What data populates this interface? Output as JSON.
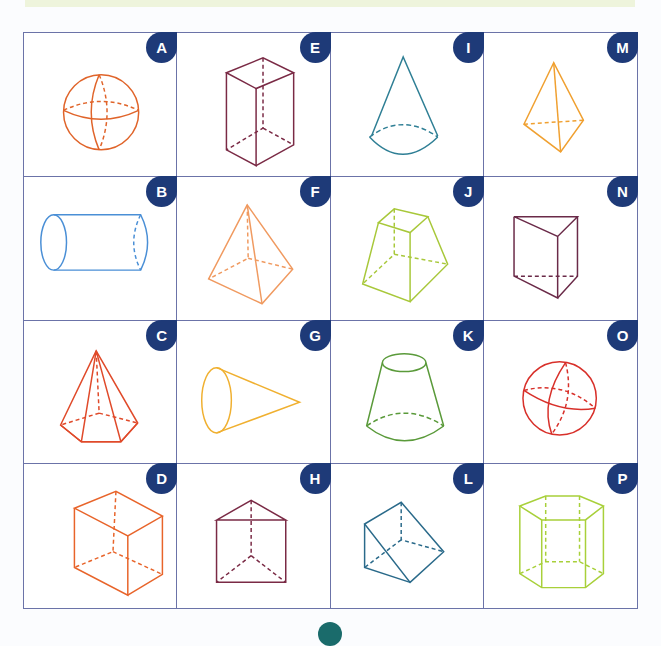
{
  "colors": {
    "grid_border": "#6b73a8",
    "badge_bg": "#1e3a78",
    "badge_text": "#ffffff",
    "top_band": "#eef4dc",
    "bottom_dot": "#1a6b6b"
  },
  "cells": [
    {
      "letter": "A",
      "shape": "sphere",
      "color": "#e0642a"
    },
    {
      "letter": "E",
      "shape": "rectangular-prism",
      "color": "#7a2a45"
    },
    {
      "letter": "I",
      "shape": "cone",
      "color": "#2f7f95"
    },
    {
      "letter": "M",
      "shape": "triangular-pyramid",
      "color": "#f0a030"
    },
    {
      "letter": "B",
      "shape": "cylinder",
      "color": "#4a8fd6"
    },
    {
      "letter": "F",
      "shape": "square-pyramid",
      "color": "#f09a60"
    },
    {
      "letter": "J",
      "shape": "square-frustum",
      "color": "#a8c83a"
    },
    {
      "letter": "N",
      "shape": "triangular-prism",
      "color": "#6a2a48"
    },
    {
      "letter": "C",
      "shape": "hexagonal-pyramid",
      "color": "#e04a2a"
    },
    {
      "letter": "G",
      "shape": "cone-sideways",
      "color": "#f0b030"
    },
    {
      "letter": "K",
      "shape": "conical-frustum",
      "color": "#5a9a3a"
    },
    {
      "letter": "O",
      "shape": "sphere-tilted",
      "color": "#d8302a"
    },
    {
      "letter": "D",
      "shape": "cube",
      "color": "#e8642a"
    },
    {
      "letter": "H",
      "shape": "triangular-prism-upright",
      "color": "#7a2a45"
    },
    {
      "letter": "L",
      "shape": "triangular-prism-tilted",
      "color": "#2a6a8a"
    },
    {
      "letter": "P",
      "shape": "hexagonal-prism",
      "color": "#a8d03a"
    }
  ]
}
